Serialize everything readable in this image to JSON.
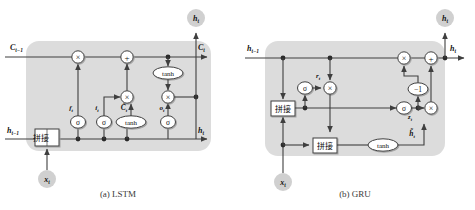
{
  "figure": {
    "background": "#ffffff",
    "panel_fill": "#dcdcdc",
    "node_fill": "#d0d0d0",
    "line_color": "#3f3f3f",
    "text_color": "#111111"
  },
  "panels": [
    {
      "id": "lstm",
      "caption": "(a) LSTM",
      "inputs": [
        {
          "name": "cell-state-in",
          "label": "C",
          "sub": "t-1"
        },
        {
          "name": "hidden-state-in",
          "label": "h",
          "sub": "t-1"
        },
        {
          "name": "input-x",
          "label": "x",
          "sub": "t"
        }
      ],
      "outputs": [
        {
          "name": "cell-state-out",
          "label": "C",
          "sub": "t"
        },
        {
          "name": "hidden-state-out",
          "label": "h",
          "sub": "t"
        },
        {
          "name": "hidden-state-top",
          "label": "h",
          "sub": "t"
        }
      ],
      "gates": [
        {
          "name": "forget-gate",
          "label": "f",
          "sub": "t",
          "activation": "σ"
        },
        {
          "name": "input-gate",
          "label": "i",
          "sub": "t",
          "activation": "σ"
        },
        {
          "name": "candidate-cell",
          "label": "C̃",
          "sub": "t",
          "activation": "tanh"
        },
        {
          "name": "output-gate",
          "label": "o",
          "sub": "t",
          "activation": "σ"
        }
      ],
      "operators": [
        {
          "name": "multiply-forget",
          "symbol": "×"
        },
        {
          "name": "add-cell",
          "symbol": "+"
        },
        {
          "name": "multiply-input",
          "symbol": "×"
        },
        {
          "name": "multiply-output",
          "symbol": "×"
        },
        {
          "name": "tanh-cell",
          "symbol": "tanh"
        }
      ],
      "concat_boxes": [
        {
          "name": "concat-box",
          "text": "拼接"
        }
      ]
    },
    {
      "id": "gru",
      "caption": "(b) GRU",
      "inputs": [
        {
          "name": "hidden-state-in",
          "label": "h",
          "sub": "t-1"
        },
        {
          "name": "input-x",
          "label": "x",
          "sub": "t"
        }
      ],
      "outputs": [
        {
          "name": "hidden-state-out",
          "label": "h",
          "sub": "t"
        },
        {
          "name": "hidden-state-top",
          "label": "h",
          "sub": "t"
        }
      ],
      "gates": [
        {
          "name": "reset-gate",
          "label": "r",
          "sub": "t",
          "activation": "σ"
        },
        {
          "name": "update-gate",
          "label": "z",
          "sub": "t",
          "activation": "σ"
        },
        {
          "name": "candidate-hidden",
          "label": "h̃",
          "sub": "t",
          "activation": "tanh"
        }
      ],
      "operators": [
        {
          "name": "multiply-reset",
          "symbol": "×"
        },
        {
          "name": "multiply-update-left",
          "symbol": "×"
        },
        {
          "name": "multiply-update-right",
          "symbol": "×"
        },
        {
          "name": "add-hidden",
          "symbol": "+"
        },
        {
          "name": "one-minus",
          "symbol": "−1"
        }
      ],
      "concat_boxes": [
        {
          "name": "concat-box-upper",
          "text": "拼接"
        },
        {
          "name": "concat-box-lower",
          "text": "拼接"
        }
      ]
    }
  ],
  "labels": {
    "lstm": {
      "C_prev": "C",
      "C_prev_sub": "t−1",
      "C_out": "C",
      "C_out_sub": "t",
      "h_prev": "h",
      "h_prev_sub": "t−1",
      "h_out": "h",
      "h_out_sub": "t",
      "h_top": "h",
      "h_top_sub": "t",
      "x_in": "x",
      "x_in_sub": "t",
      "f": "f",
      "f_sub": "t",
      "i": "i",
      "i_sub": "t",
      "Ctilde": "C̃",
      "Ctilde_sub": "t",
      "o": "o",
      "o_sub": "t",
      "sigma": "σ",
      "tanh": "tanh",
      "times": "×",
      "plus": "+",
      "concat": "拼接",
      "caption": "(a) LSTM"
    },
    "gru": {
      "h_prev": "h",
      "h_prev_sub": "t−1",
      "h_out": "h",
      "h_out_sub": "t",
      "h_top": "h",
      "h_top_sub": "t",
      "x_in": "x",
      "x_in_sub": "t",
      "r": "r",
      "r_sub": "t",
      "z": "z",
      "z_sub": "t",
      "htilde": "h̃",
      "htilde_sub": "t",
      "sigma": "σ",
      "tanh": "tanh",
      "times": "×",
      "plus": "+",
      "minus_one": "−1",
      "concat": "拼接",
      "caption": "(b) GRU"
    }
  }
}
